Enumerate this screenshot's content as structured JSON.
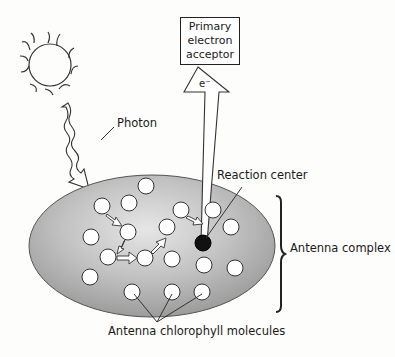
{
  "diagram": {
    "labels": {
      "acceptor_line1": "Primary",
      "acceptor_line2": "electron",
      "acceptor_line3": "acceptor",
      "electron": "e⁻",
      "photon": "Photon",
      "reaction_center": "Reaction center",
      "antenna_complex": "Antenna complex",
      "antenna_molecules": "Antenna chlorophyll molecules"
    },
    "icons": [
      "sun-icon",
      "photon-wave-arrow-icon",
      "electron-arrow-icon",
      "brace-icon"
    ],
    "colors": {
      "ellipse_fill": "#a9a9a9",
      "ellipse_highlight": "#e2e2e2",
      "molecule_fill": "#ffffff",
      "reaction_center_fill": "#111111",
      "line": "#222222"
    }
  }
}
